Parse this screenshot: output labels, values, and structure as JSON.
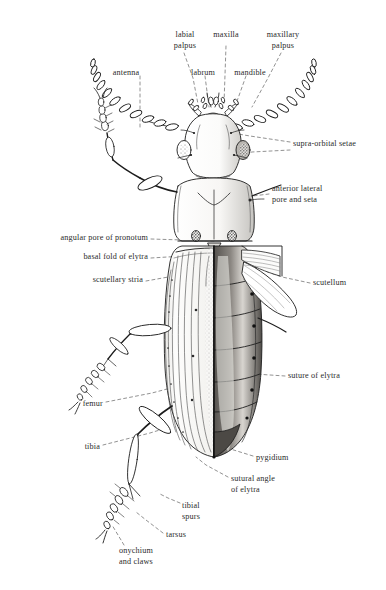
{
  "figure": {
    "kind": "scientific-illustration",
    "style": "pen-and-ink line drawing with stippling and hatching",
    "background_color": "#ffffff",
    "ink_color": "#1c1c1c",
    "leader_line_color": "#6b6b6b",
    "label_text_color": "#2b2b2b"
  },
  "labels": [
    {
      "id": "labial-palpus",
      "text": "labial\npalpus",
      "x": 185,
      "y": 30,
      "align": "ctr"
    },
    {
      "id": "maxilla",
      "text": "maxilla",
      "x": 226,
      "y": 30,
      "align": "ctr"
    },
    {
      "id": "maxillary-palpus",
      "text": "maxillary\npalpus",
      "x": 283,
      "y": 30,
      "align": "ctr"
    },
    {
      "id": "antenna",
      "text": "antenna",
      "x": 126,
      "y": 68,
      "align": "ctr"
    },
    {
      "id": "labrum",
      "text": "labrum",
      "x": 203,
      "y": 68,
      "align": "ctr"
    },
    {
      "id": "mandible",
      "text": "mandible",
      "x": 250,
      "y": 68,
      "align": "ctr"
    },
    {
      "id": "supra-orbital-setae",
      "text": "supra-orbital setae",
      "x": 293,
      "y": 145,
      "align": "lft"
    },
    {
      "id": "anterior-lateral-pore",
      "text": "anterior lateral\npore and seta",
      "x": 272,
      "y": 190,
      "align": "lft"
    },
    {
      "id": "angular-pore-of-pronotum",
      "text": "angular pore of pronotum",
      "x": 148,
      "y": 239,
      "align": "rgt"
    },
    {
      "id": "basal-fold-of-elytra",
      "text": "basal fold of elytra",
      "x": 148,
      "y": 258,
      "align": "rgt"
    },
    {
      "id": "scutellary-stria",
      "text": "scutellary stria",
      "x": 143,
      "y": 280,
      "align": "rgt"
    },
    {
      "id": "scutellum",
      "text": "scutellum",
      "x": 313,
      "y": 283,
      "align": "lft"
    },
    {
      "id": "suture-of-elytra",
      "text": "suture of elytra",
      "x": 288,
      "y": 376,
      "align": "lft"
    },
    {
      "id": "femur",
      "text": "femur",
      "x": 103,
      "y": 404,
      "align": "rgt"
    },
    {
      "id": "tibia",
      "text": "tibia",
      "x": 100,
      "y": 447,
      "align": "rgt"
    },
    {
      "id": "pygidium",
      "text": "pygidium",
      "x": 256,
      "y": 458,
      "align": "lft"
    },
    {
      "id": "sutural-angle-of-elytra",
      "text": "sutural angle\nof elytra",
      "x": 231,
      "y": 479,
      "align": "lft"
    },
    {
      "id": "tibial-spurs",
      "text": "tibial\nspurs",
      "x": 182,
      "y": 506,
      "align": "lft"
    },
    {
      "id": "tarsus",
      "text": "tarsus",
      "x": 166,
      "y": 535,
      "align": "lft"
    },
    {
      "id": "onychium-and-claws",
      "text": "onychium\nand claws",
      "x": 119,
      "y": 551,
      "align": "lft"
    }
  ],
  "anatomy_parts": [
    "antenna",
    "labrum",
    "mandible",
    "maxilla",
    "labial palpus",
    "maxillary palpus",
    "supra-orbital setae",
    "anterior lateral pore and seta",
    "pronotum",
    "angular pore of pronotum",
    "scutellum",
    "basal fold of elytra",
    "scutellary stria",
    "suture of elytra",
    "sutural angle of elytra",
    "pygidium",
    "femur",
    "tibia",
    "tibial spurs",
    "tarsus",
    "onychium and claws"
  ]
}
